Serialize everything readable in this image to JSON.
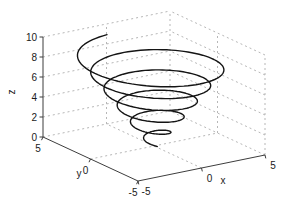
{
  "figure": {
    "background": "#ffffff"
  },
  "chart_data": {
    "type": "line",
    "subtype": "3d-parametric-curve",
    "title": "",
    "xlabel": "x",
    "ylabel": "y",
    "zlabel": "z",
    "xlim": [
      -5,
      5
    ],
    "ylim": [
      -5,
      5
    ],
    "zlim": [
      0,
      10
    ],
    "xticks": [
      -5,
      0,
      5
    ],
    "yticks": [
      -5,
      0,
      5
    ],
    "zticks": [
      0,
      2,
      4,
      6,
      8,
      10
    ],
    "grid": true,
    "box": false,
    "view": {
      "azimuth": -37.5,
      "elevation": 30
    },
    "series": [
      {
        "name": "conical helix",
        "description": "spiral of ~5.5 turns, radius growing with height",
        "color": "#141414",
        "line_width": 1.4,
        "turns": 5.5,
        "z_range": [
          0.1,
          8.95
        ],
        "radius_range": [
          0.35,
          4.95
        ],
        "samples": 520
      }
    ],
    "colors": {
      "grid": "#b7b7b7",
      "axis": "#3d3d3d",
      "tick_label": "#1a1a1a"
    }
  }
}
